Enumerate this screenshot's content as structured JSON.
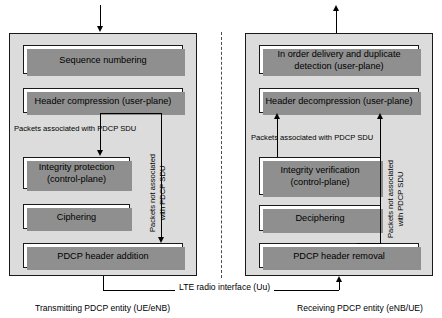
{
  "diagram": {
    "interface_label": "LTE radio interface (Uu)",
    "left": {
      "caption": "Transmitting PDCP entity (UE/eNB)",
      "boxes": [
        {
          "id": "sequence-numbering",
          "label": "Sequence numbering"
        },
        {
          "id": "header-compression",
          "label": "Header compression (user-plane)"
        },
        {
          "id": "integrity-protection",
          "label": "Integrity protection\n(control-plane)",
          "line1": "Integrity protection",
          "line2": "(control-plane)"
        },
        {
          "id": "ciphering",
          "label": "Ciphering"
        },
        {
          "id": "pdcp-header-addition",
          "label": "PDCP header addition"
        }
      ],
      "annotations": [
        {
          "id": "packets-associated",
          "text": "Packets associated with PDCP SDU"
        },
        {
          "id": "packets-not-associated",
          "line1": "Packets not associated",
          "line2": "with PDCP SDU"
        }
      ]
    },
    "right": {
      "caption": "Receiving PDCP entity (eNB/UE)",
      "boxes": [
        {
          "id": "in-order-delivery",
          "line1": "In order delivery and duplicate",
          "line2": "detection (user-plane)"
        },
        {
          "id": "header-decompression",
          "label": "Header decompression (user-plane)"
        },
        {
          "id": "integrity-verification",
          "line1": "Integrity verification",
          "line2": "(control-plane)"
        },
        {
          "id": "deciphering",
          "label": "Deciphering"
        },
        {
          "id": "pdcp-header-removal",
          "label": "PDCP header removal"
        }
      ],
      "annotations": [
        {
          "id": "packets-associated",
          "text": "Packets associated with PDCP SDU"
        },
        {
          "id": "packets-not-associated",
          "line1": "Packets not associated",
          "line2": "with PDCP SDU"
        }
      ]
    },
    "colors": {
      "panel_fill": "#dcdcdc",
      "box_fill": "#ffffff",
      "stroke": "#1a1a1a",
      "shadow": "#8f8f8f",
      "divider": "#4d4d4d"
    }
  }
}
